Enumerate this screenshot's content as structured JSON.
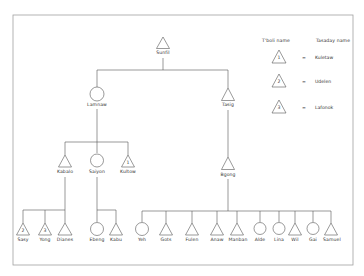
{
  "legend": {
    "header_left": "T'boli name",
    "header_right": "Tasaday name",
    "entries": [
      {
        "number": "1",
        "equals": "=",
        "name": "Kuletaw"
      },
      {
        "number": "2",
        "equals": "=",
        "name": "Udelen"
      },
      {
        "number": "3",
        "equals": "=",
        "name": "Lafonok"
      }
    ]
  },
  "tree": {
    "gen1": [
      {
        "name": "Sunfil",
        "sex": "male"
      }
    ],
    "gen2": [
      {
        "name": "Lamnaw",
        "sex": "female"
      },
      {
        "name": "Tasig",
        "sex": "male"
      }
    ],
    "gen3": [
      {
        "name": "Kabalo",
        "sex": "male",
        "parent": "Lamnaw"
      },
      {
        "name": "Saiyon",
        "sex": "female",
        "parent": "Lamnaw"
      },
      {
        "name": "Kultow",
        "sex": "male",
        "parent": "Lamnaw",
        "marker": "1"
      },
      {
        "name": "Bgong",
        "sex": "male",
        "parent": "Tasig"
      }
    ],
    "gen4": [
      {
        "name": "Sasy",
        "sex": "male",
        "parent": "Kabalo",
        "marker": "2"
      },
      {
        "name": "Yong",
        "sex": "male",
        "parent": "Kabalo",
        "marker": "3"
      },
      {
        "name": "Dianes",
        "sex": "male",
        "parent": "Kabalo"
      },
      {
        "name": "Ebeng",
        "sex": "female",
        "parent": "Saiyon"
      },
      {
        "name": "Kabu",
        "sex": "male",
        "parent": "Saiyon"
      },
      {
        "name": "Yeh",
        "sex": "female",
        "parent": "Bgong"
      },
      {
        "name": "Gots",
        "sex": "male",
        "parent": "Bgong"
      },
      {
        "name": "Fulen",
        "sex": "male",
        "parent": "Bgong"
      },
      {
        "name": "Anaw",
        "sex": "male",
        "parent": "Bgong"
      },
      {
        "name": "Manban",
        "sex": "male",
        "parent": "Bgong"
      },
      {
        "name": "Alde",
        "sex": "female",
        "parent": "Bgong"
      },
      {
        "name": "Lina",
        "sex": "female",
        "parent": "Bgong"
      },
      {
        "name": "Wil",
        "sex": "male",
        "parent": "Bgong"
      },
      {
        "name": "Gai",
        "sex": "female",
        "parent": "Bgong"
      },
      {
        "name": "Samuel",
        "sex": "male",
        "parent": "Bgong"
      }
    ]
  },
  "colors": {
    "line": "#555555",
    "frame": "#9a9a9a",
    "background": "#ffffff"
  }
}
